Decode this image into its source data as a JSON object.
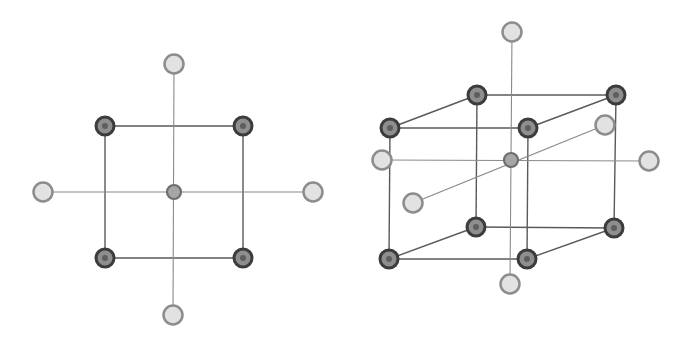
{
  "colors": {
    "background": "#ffffff",
    "edge": "#5a5a5a",
    "axis": "#8a8a8a",
    "dark_ring": "#3c3c3c",
    "dark_fill": "#8e8e8e",
    "dark_core": "#5e5e5e",
    "light_ring": "#8c8c8c",
    "light_fill": "#e2e2e2",
    "center_ring": "#6e6e6e",
    "center_fill": "#a6a6a6"
  },
  "diagrams": [
    {
      "name": "square-2d",
      "nodes": [
        {
          "id": "tl",
          "type": "dark",
          "x": 105,
          "y": 126
        },
        {
          "id": "tr",
          "type": "dark",
          "x": 243,
          "y": 126
        },
        {
          "id": "bl",
          "type": "dark",
          "x": 105,
          "y": 258
        },
        {
          "id": "br",
          "type": "dark",
          "x": 243,
          "y": 258
        },
        {
          "id": "c",
          "type": "center",
          "x": 174,
          "y": 192
        },
        {
          "id": "top",
          "type": "light",
          "x": 174,
          "y": 64
        },
        {
          "id": "bottom",
          "type": "light",
          "x": 173,
          "y": 315
        },
        {
          "id": "left",
          "type": "light",
          "x": 43,
          "y": 192
        },
        {
          "id": "right",
          "type": "light",
          "x": 313,
          "y": 192
        }
      ],
      "edges": [
        {
          "from": "tl",
          "to": "tr",
          "kind": "edge"
        },
        {
          "from": "tr",
          "to": "br",
          "kind": "edge"
        },
        {
          "from": "br",
          "to": "bl",
          "kind": "edge"
        },
        {
          "from": "bl",
          "to": "tl",
          "kind": "edge"
        },
        {
          "from": "top",
          "to": "bottom",
          "kind": "axis"
        },
        {
          "from": "left",
          "to": "right",
          "kind": "axis"
        }
      ]
    },
    {
      "name": "cube-3d",
      "nodes": [
        {
          "id": "btl",
          "type": "dark",
          "x": 477,
          "y": 95
        },
        {
          "id": "btr",
          "type": "dark",
          "x": 616,
          "y": 95
        },
        {
          "id": "bbl",
          "type": "dark",
          "x": 476,
          "y": 227
        },
        {
          "id": "bbr",
          "type": "dark",
          "x": 614,
          "y": 228
        },
        {
          "id": "ftl",
          "type": "dark",
          "x": 390,
          "y": 128
        },
        {
          "id": "ftr",
          "type": "dark",
          "x": 528,
          "y": 128
        },
        {
          "id": "fbl",
          "type": "dark",
          "x": 389,
          "y": 259
        },
        {
          "id": "fbr",
          "type": "dark",
          "x": 527,
          "y": 259
        },
        {
          "id": "c",
          "type": "center",
          "x": 511,
          "y": 160
        },
        {
          "id": "top",
          "type": "light",
          "x": 512,
          "y": 32
        },
        {
          "id": "bottom",
          "type": "light",
          "x": 510,
          "y": 284
        },
        {
          "id": "left",
          "type": "light",
          "x": 382,
          "y": 160
        },
        {
          "id": "right",
          "type": "light",
          "x": 649,
          "y": 161
        },
        {
          "id": "back",
          "type": "light",
          "x": 605,
          "y": 125
        },
        {
          "id": "front",
          "type": "light",
          "x": 413,
          "y": 203
        }
      ],
      "edges": [
        {
          "from": "btl",
          "to": "btr",
          "kind": "edge"
        },
        {
          "from": "btr",
          "to": "bbr",
          "kind": "edge"
        },
        {
          "from": "bbr",
          "to": "bbl",
          "kind": "edge"
        },
        {
          "from": "bbl",
          "to": "btl",
          "kind": "edge"
        },
        {
          "from": "ftl",
          "to": "ftr",
          "kind": "edge"
        },
        {
          "from": "ftr",
          "to": "fbr",
          "kind": "edge"
        },
        {
          "from": "fbr",
          "to": "fbl",
          "kind": "edge"
        },
        {
          "from": "fbl",
          "to": "ftl",
          "kind": "edge"
        },
        {
          "from": "ftl",
          "to": "btl",
          "kind": "edge"
        },
        {
          "from": "ftr",
          "to": "btr",
          "kind": "edge"
        },
        {
          "from": "fbl",
          "to": "bbl",
          "kind": "edge"
        },
        {
          "from": "fbr",
          "to": "bbr",
          "kind": "edge"
        },
        {
          "from": "top",
          "to": "bottom",
          "kind": "axis"
        },
        {
          "from": "left",
          "to": "right",
          "kind": "axis"
        },
        {
          "from": "front",
          "to": "back",
          "kind": "axis"
        }
      ]
    }
  ]
}
